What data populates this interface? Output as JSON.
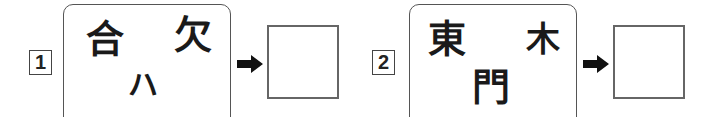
{
  "problems": [
    {
      "number": "1",
      "parts": {
        "top_left": "合",
        "top_right": "欠",
        "bottom": "ハ"
      },
      "answer": ""
    },
    {
      "number": "2",
      "parts": {
        "top_left": "東",
        "top_right": "木",
        "bottom": "門"
      },
      "answer": ""
    }
  ],
  "icons": {
    "arrow": "right-arrow-icon"
  },
  "colors": {
    "border": "#555555",
    "text": "#1a1a1a"
  }
}
